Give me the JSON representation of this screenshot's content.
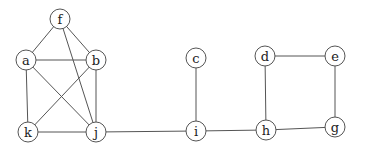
{
  "graph": {
    "node_radius": 10,
    "colors": {
      "stroke": "#555555",
      "fill": "#ffffff",
      "label": "#222222",
      "background": "#ffffff"
    },
    "nodes": [
      {
        "id": "f",
        "label": "f",
        "x": 60,
        "y": 19
      },
      {
        "id": "a",
        "label": "a",
        "x": 26,
        "y": 60
      },
      {
        "id": "b",
        "label": "b",
        "x": 96,
        "y": 60
      },
      {
        "id": "k",
        "label": "k",
        "x": 28,
        "y": 132
      },
      {
        "id": "j",
        "label": "j",
        "x": 96,
        "y": 132
      },
      {
        "id": "c",
        "label": "c",
        "x": 196,
        "y": 58
      },
      {
        "id": "i",
        "label": "i",
        "x": 196,
        "y": 131
      },
      {
        "id": "d",
        "label": "d",
        "x": 265,
        "y": 56
      },
      {
        "id": "e",
        "label": "e",
        "x": 335,
        "y": 56
      },
      {
        "id": "h",
        "label": "h",
        "x": 266,
        "y": 130
      },
      {
        "id": "g",
        "label": "g",
        "x": 335,
        "y": 127
      }
    ],
    "edges": [
      [
        "f",
        "a"
      ],
      [
        "f",
        "b"
      ],
      [
        "f",
        "j"
      ],
      [
        "a",
        "b"
      ],
      [
        "a",
        "k"
      ],
      [
        "a",
        "j"
      ],
      [
        "b",
        "k"
      ],
      [
        "b",
        "j"
      ],
      [
        "k",
        "j"
      ],
      [
        "j",
        "i"
      ],
      [
        "c",
        "i"
      ],
      [
        "i",
        "h"
      ],
      [
        "d",
        "h"
      ],
      [
        "d",
        "e"
      ],
      [
        "e",
        "g"
      ],
      [
        "h",
        "g"
      ]
    ]
  }
}
